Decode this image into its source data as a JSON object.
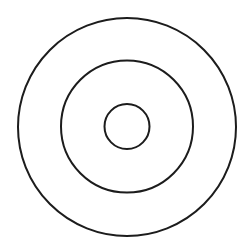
{
  "diagram": {
    "type": "concentric-circles",
    "background": "#ffffff",
    "stroke_color": "#1c1c1c",
    "stroke_width": 2,
    "circles": [
      {
        "name": "outer-ring",
        "cx": 127,
        "cy": 127,
        "r": 109
      },
      {
        "name": "middle-ring",
        "cx": 127,
        "cy": 126.5,
        "r": 66
      },
      {
        "name": "inner-ring",
        "cx": 127,
        "cy": 126.5,
        "r": 22.5
      }
    ]
  }
}
